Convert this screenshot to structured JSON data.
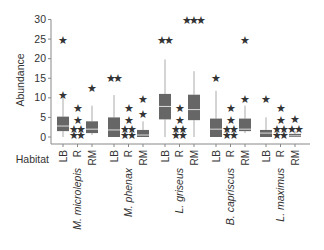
{
  "chart_data": {
    "type": "box",
    "title": "",
    "xlabel": "Habitat",
    "ylabel": "Abundance",
    "ylim": [
      0,
      30
    ],
    "yticks": [
      0,
      5,
      10,
      15,
      20,
      25,
      30
    ],
    "grid": false,
    "legend": null,
    "habitats": [
      "LB",
      "R",
      "RM"
    ],
    "species": [
      "M. microlepis",
      "M. phenax",
      "L. griseus",
      "B. capriscus",
      "L. maximus"
    ],
    "boxes": [
      {
        "species": "M. microlepis",
        "habitat": "LB",
        "whisker_low": 0,
        "q1": 1.5,
        "median": 2.8,
        "q3": 5.2,
        "whisker_high": 10,
        "outliers": [
          10.8,
          24.8
        ]
      },
      {
        "species": "M. microlepis",
        "habitat": "R",
        "whisker_low": 0,
        "q1": 0,
        "median": 0,
        "q3": 0,
        "whisker_high": 0,
        "outliers": [
          0.5,
          0.5,
          2,
          2,
          4.3,
          7.5
        ]
      },
      {
        "species": "M. microlepis",
        "habitat": "RM",
        "whisker_low": 0.5,
        "q1": 1,
        "median": 2,
        "q3": 4,
        "whisker_high": 8,
        "outliers": [
          12.5
        ]
      },
      {
        "species": "M. phenax",
        "habitat": "LB",
        "whisker_low": 0,
        "q1": 0,
        "median": 1.8,
        "q3": 5,
        "whisker_high": 10.7,
        "outliers": [
          15,
          15
        ]
      },
      {
        "species": "M. phenax",
        "habitat": "R",
        "whisker_low": 0,
        "q1": 0,
        "median": 0,
        "q3": 0,
        "whisker_high": 0,
        "outliers": [
          0.5,
          0.5,
          2,
          2,
          4.3,
          7.5
        ]
      },
      {
        "species": "M. phenax",
        "habitat": "RM",
        "whisker_low": 0,
        "q1": 0,
        "median": 0.5,
        "q3": 1.8,
        "whisker_high": 4,
        "outliers": [
          6,
          9.8
        ]
      },
      {
        "species": "L. griseus",
        "habitat": "LB",
        "whisker_low": 0,
        "q1": 4.5,
        "median": 7.8,
        "q3": 11,
        "whisker_high": 19.8,
        "outliers": [
          24.8,
          24.8
        ]
      },
      {
        "species": "L. griseus",
        "habitat": "R",
        "whisker_low": 0,
        "q1": 0,
        "median": 0,
        "q3": 0,
        "whisker_high": 0,
        "outliers": [
          0.5,
          0.5,
          2,
          2,
          4.3,
          7.5
        ]
      },
      {
        "species": "L. griseus",
        "habitat": "RM",
        "whisker_low": 0,
        "q1": 4.3,
        "median": 7,
        "q3": 10.8,
        "whisker_high": 16.8,
        "outliers": [
          29.8,
          29.8,
          29.8
        ]
      },
      {
        "species": "B. capriscus",
        "habitat": "LB",
        "whisker_low": 0,
        "q1": 0,
        "median": 2,
        "q3": 4.7,
        "whisker_high": 11.8,
        "outliers": [
          15
        ]
      },
      {
        "species": "B. capriscus",
        "habitat": "R",
        "whisker_low": 0,
        "q1": 0,
        "median": 0,
        "q3": 0,
        "whisker_high": 0,
        "outliers": [
          0.5,
          0.5,
          2,
          2,
          4.3,
          7.5
        ]
      },
      {
        "species": "B. capriscus",
        "habitat": "RM",
        "whisker_low": 1,
        "q1": 1.5,
        "median": 2,
        "q3": 4.7,
        "whisker_high": 8,
        "outliers": [
          9.8,
          24.8
        ]
      },
      {
        "species": "L. maximus",
        "habitat": "LB",
        "whisker_low": 0,
        "q1": 0,
        "median": 1,
        "q3": 1.8,
        "whisker_high": 5,
        "outliers": [
          9.8
        ]
      },
      {
        "species": "L. maximus",
        "habitat": "R",
        "whisker_low": 0,
        "q1": 0,
        "median": 0,
        "q3": 0,
        "whisker_high": 0,
        "outliers": [
          0.5,
          0.5,
          2,
          2,
          4.3,
          7.5
        ]
      },
      {
        "species": "L. maximus",
        "habitat": "RM",
        "whisker_low": 0,
        "q1": 0,
        "median": 0.3,
        "q3": 0.8,
        "whisker_high": 1.5,
        "outliers": [
          2,
          2,
          4.5
        ]
      }
    ]
  },
  "labels": {
    "ylabel": "Abundance",
    "xlabel": "Habitat"
  },
  "colors": {
    "box_fill": "#666666",
    "median_line": "#dddddd",
    "whisker": "#aaaaaa",
    "axis": "#888888",
    "text": "#333333",
    "outlier": "#333333"
  }
}
